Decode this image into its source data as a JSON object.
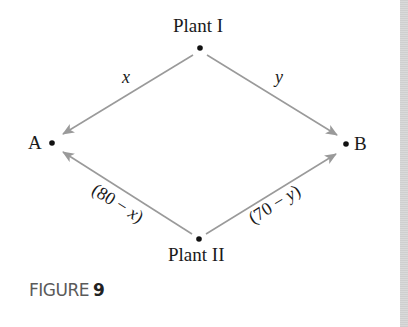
{
  "figure": {
    "caption_word": "FIGURE",
    "caption_number": "9"
  },
  "nodes": {
    "plant_1": {
      "label": "Plant I",
      "x": 200,
      "y": 48
    },
    "plant_2": {
      "label": "Plant II",
      "x": 199,
      "y": 239
    },
    "a": {
      "label": "A",
      "x": 52,
      "y": 143
    },
    "b": {
      "label": "B",
      "x": 346,
      "y": 144
    }
  },
  "edges": [
    {
      "from": "Plant I",
      "to": "A",
      "label": "x"
    },
    {
      "from": "Plant I",
      "to": "B",
      "label": "y"
    },
    {
      "from": "Plant II",
      "to": "A",
      "label_open": "(80 − ",
      "label_var": "x",
      "label_close": ")"
    },
    {
      "from": "Plant II",
      "to": "B",
      "label_open": "(70 − ",
      "label_var": "y",
      "label_close": ")"
    }
  ],
  "colors": {
    "arrow": "#9a9a9a",
    "dot": "#111111",
    "text": "#1a1a1a",
    "caption": "#5a5a5a"
  }
}
